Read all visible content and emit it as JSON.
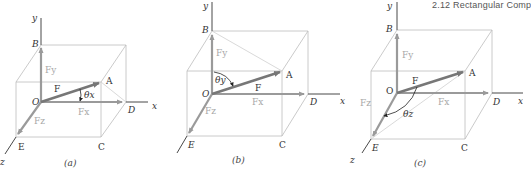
{
  "header": {
    "text": "2.12 Rectangular Comp"
  },
  "colors": {
    "box_edges": "#bdbdbd",
    "component_vectors": "#9a9a9a",
    "force_vector": "#777777",
    "axes": "#333333",
    "component_labels": "#a8a8a8"
  },
  "panels": [
    {
      "caption": "(a)",
      "angle_label": "θx",
      "labels": {
        "y": "y",
        "x": "x",
        "z": "z",
        "B": "B",
        "A": "A",
        "O": "O",
        "D": "D",
        "E": "E",
        "C": "C",
        "F": "F",
        "Fx": "Fx",
        "Fy": "Fy",
        "Fz": "Fz"
      }
    },
    {
      "caption": "(b)",
      "angle_label": "θy",
      "labels": {
        "y": "y",
        "x": "x",
        "z": "z",
        "B": "B",
        "A": "A",
        "O": "O",
        "D": "D",
        "E": "E",
        "C": "C",
        "F": "F",
        "Fx": "Fx",
        "Fy": "Fy",
        "Fz": "Fz"
      }
    },
    {
      "caption": "(c)",
      "angle_label": "θz",
      "labels": {
        "y": "y",
        "x": "x",
        "z": "z",
        "B": "B",
        "A": "A",
        "O": "O",
        "D": "D",
        "E": "E",
        "C": "C",
        "F": "F",
        "Fx": "Fx",
        "Fy": "Fy",
        "Fz": "Fz"
      }
    }
  ]
}
